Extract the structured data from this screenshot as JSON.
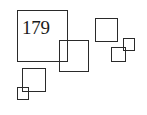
{
  "page_number": "179",
  "stroke_color": "#2a2a2a",
  "background": "#ffffff",
  "squares": [
    {
      "name": "large-square",
      "x": 17,
      "y": 10,
      "w": 51,
      "h": 52
    },
    {
      "name": "medium-square-overlap",
      "x": 59,
      "y": 40,
      "w": 30,
      "h": 32
    },
    {
      "name": "upper-right-square",
      "x": 95,
      "y": 18,
      "w": 23,
      "h": 24
    },
    {
      "name": "small-right-square",
      "x": 123,
      "y": 38,
      "w": 12,
      "h": 13
    },
    {
      "name": "lower-right-square",
      "x": 111,
      "y": 47,
      "w": 15,
      "h": 15
    },
    {
      "name": "lower-left-square",
      "x": 22,
      "y": 68,
      "w": 24,
      "h": 24
    },
    {
      "name": "tiny-left-square",
      "x": 17,
      "y": 87,
      "w": 12,
      "h": 13
    }
  ]
}
